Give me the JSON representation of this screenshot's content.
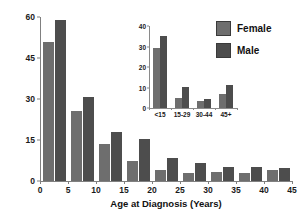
{
  "chart_data": [
    {
      "id": "main",
      "type": "bar",
      "title": "",
      "xlabel": "Age at Diagnosis (Years)",
      "ylabel": "Incidence per Year per Million",
      "xlim": [
        0,
        45
      ],
      "ylim": [
        0,
        60
      ],
      "ytick_labels": [
        "0",
        "15",
        "30",
        "45",
        "60"
      ],
      "ytick_values": [
        0,
        15,
        30,
        45,
        60
      ],
      "xtick_labels": [
        "0",
        "5",
        "10",
        "15",
        "20",
        "25",
        "30",
        "35",
        "40",
        "45"
      ],
      "xtick_values": [
        0,
        5,
        10,
        15,
        20,
        25,
        30,
        35,
        40,
        45
      ],
      "grid": false,
      "categories": [
        "0-5",
        "5-10",
        "10-15",
        "15-20",
        "20-25",
        "25-30",
        "30-35",
        "35-40",
        "40-45"
      ],
      "bin_starts": [
        0,
        5,
        10,
        15,
        20,
        25,
        30,
        35,
        40
      ],
      "series": [
        {
          "name": "Female",
          "color": "#6e6e6e",
          "values": [
            51.0,
            25.5,
            13.5,
            7.5,
            4.0,
            3.0,
            3.2,
            3.0,
            4.0
          ]
        },
        {
          "name": "Male",
          "color": "#4d4d4d",
          "values": [
            58.8,
            30.8,
            18.0,
            15.3,
            8.6,
            6.5,
            5.1,
            5.1,
            4.6
          ]
        }
      ]
    },
    {
      "id": "inset",
      "type": "bar",
      "title": "",
      "xlabel": "",
      "ylabel": "",
      "ylim": [
        0,
        40
      ],
      "ytick_labels": [
        "0",
        "10",
        "20",
        "30",
        "40"
      ],
      "ytick_values": [
        0,
        10,
        20,
        30,
        40
      ],
      "grid": false,
      "categories": [
        "<15",
        "15-29",
        "30-44",
        "45+"
      ],
      "series": [
        {
          "name": "Female",
          "color": "#6e6e6e",
          "values": [
            29.5,
            4.9,
            3.4,
            6.9
          ]
        },
        {
          "name": "Male",
          "color": "#4d4d4d",
          "values": [
            35.2,
            10.1,
            4.5,
            11.4
          ]
        }
      ]
    }
  ],
  "legend": {
    "position": "top-right",
    "items": [
      {
        "label": "Female",
        "color": "#6e6e6e"
      },
      {
        "label": "Male",
        "color": "#4d4d4d"
      }
    ]
  },
  "colors": {
    "female": "#6e6e6e",
    "male": "#4d4d4d",
    "axis": "#808080",
    "text": "#111111",
    "background": "#ffffff"
  }
}
